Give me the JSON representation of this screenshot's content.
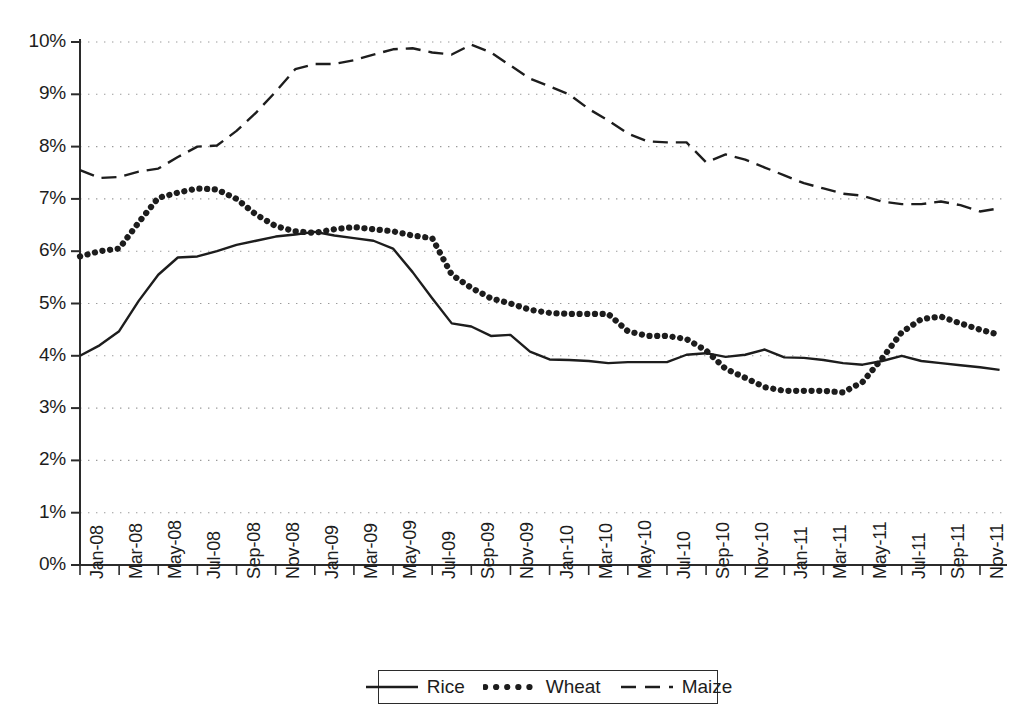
{
  "chart_data": {
    "type": "line",
    "title": "",
    "xlabel": "",
    "ylabel": "",
    "ylim": [
      0,
      10
    ],
    "ytick_labels": [
      "0%",
      "1%",
      "2%",
      "3%",
      "4%",
      "5%",
      "6%",
      "7%",
      "8%",
      "9%",
      "10%"
    ],
    "ytick_values": [
      0,
      1,
      2,
      3,
      4,
      5,
      6,
      7,
      8,
      9,
      10
    ],
    "grid": "horizontal-dotted",
    "legend_position": "bottom-center",
    "x": [
      "Jan-08",
      "Feb-08",
      "Mar-08",
      "Apr-08",
      "May-08",
      "Jun-08",
      "Jul-08",
      "Aug-08",
      "Sep-08",
      "Oct-08",
      "Nov-08",
      "Dec-08",
      "Jan-09",
      "Feb-09",
      "Mar-09",
      "Apr-09",
      "May-09",
      "Jun-09",
      "Jul-09",
      "Aug-09",
      "Sep-09",
      "Oct-09",
      "Nov-09",
      "Dec-09",
      "Jan-10",
      "Feb-10",
      "Mar-10",
      "Apr-10",
      "May-10",
      "Jun-10",
      "Jul-10",
      "Aug-10",
      "Sep-10",
      "Oct-10",
      "Nov-10",
      "Dec-10",
      "Jan-11",
      "Feb-11",
      "Mar-11",
      "Apr-11",
      "May-11",
      "Jun-11",
      "Jul-11",
      "Aug-11",
      "Sep-11",
      "Oct-11",
      "Nov-11",
      "Dec-11"
    ],
    "xtick_labels": [
      "Jan-08",
      "Mar-08",
      "May-08",
      "Jul-08",
      "Sep-08",
      "Nov-08",
      "Jan-09",
      "Mar-09",
      "May-09",
      "Jul-09",
      "Sep-09",
      "Nov-09",
      "Jan-10",
      "Mar-10",
      "May-10",
      "Jul-10",
      "Sep-10",
      "Nov-10",
      "Jan-11",
      "Mar-11",
      "May-11",
      "Jul-11",
      "Sep-11",
      "Nov-11"
    ],
    "series": [
      {
        "name": "Rice",
        "style": "solid",
        "color": "#1d1d1d",
        "values": [
          4.0,
          4.2,
          4.47,
          5.05,
          5.55,
          5.88,
          5.9,
          6.0,
          6.12,
          6.2,
          6.28,
          6.32,
          6.37,
          6.3,
          6.25,
          6.2,
          6.05,
          5.6,
          5.1,
          4.62,
          4.56,
          4.38,
          4.4,
          4.08,
          3.93,
          3.92,
          3.9,
          3.86,
          3.88,
          3.88,
          3.88,
          4.02,
          4.05,
          3.98,
          4.02,
          4.12,
          3.97,
          3.96,
          3.92,
          3.86,
          3.83,
          3.9,
          4.0,
          3.9,
          3.86,
          3.82,
          3.78,
          3.73
        ]
      },
      {
        "name": "Wheat",
        "style": "dotted",
        "color": "#1d1d1d",
        "values": [
          5.9,
          6.0,
          6.05,
          6.55,
          7.02,
          7.12,
          7.2,
          7.18,
          7.0,
          6.7,
          6.48,
          6.38,
          6.35,
          6.42,
          6.46,
          6.42,
          6.38,
          6.3,
          6.25,
          5.55,
          5.3,
          5.1,
          5.0,
          4.88,
          4.82,
          4.8,
          4.8,
          4.8,
          4.47,
          4.38,
          4.38,
          4.32,
          4.1,
          3.75,
          3.58,
          3.4,
          3.33,
          3.33,
          3.33,
          3.3,
          3.5,
          3.95,
          4.45,
          4.7,
          4.75,
          4.62,
          4.5,
          4.4
        ]
      },
      {
        "name": "Maize",
        "style": "dashed",
        "color": "#1d1d1d",
        "values": [
          7.55,
          7.4,
          7.42,
          7.52,
          7.58,
          7.8,
          8.0,
          8.02,
          8.3,
          8.65,
          9.05,
          9.48,
          9.58,
          9.58,
          9.65,
          9.76,
          9.86,
          9.88,
          9.8,
          9.76,
          9.95,
          9.8,
          9.55,
          9.3,
          9.15,
          9.0,
          8.72,
          8.5,
          8.25,
          8.1,
          8.08,
          8.08,
          7.7,
          7.85,
          7.75,
          7.6,
          7.45,
          7.3,
          7.2,
          7.1,
          7.06,
          6.95,
          6.9,
          6.9,
          6.95,
          6.88,
          6.76,
          6.82
        ]
      }
    ]
  },
  "legend": {
    "entries": [
      {
        "label": "Rice",
        "style": "solid"
      },
      {
        "label": "Wheat",
        "style": "dotted"
      },
      {
        "label": "Maize",
        "style": "dashed"
      }
    ]
  }
}
